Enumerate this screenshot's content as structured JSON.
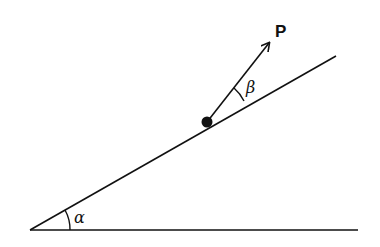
{
  "diagram": {
    "type": "inclined-plane-force",
    "labels": {
      "force": "P",
      "incline_angle": "α",
      "force_angle": "β"
    },
    "geometry": {
      "origin": [
        30,
        230
      ],
      "incline_end": [
        336,
        56
      ],
      "baseline_end": [
        358,
        230
      ],
      "point": [
        207,
        122
      ],
      "arrow_tip": [
        271,
        40
      ]
    },
    "colors": {
      "line": "#111111",
      "background": "#ffffff"
    }
  }
}
